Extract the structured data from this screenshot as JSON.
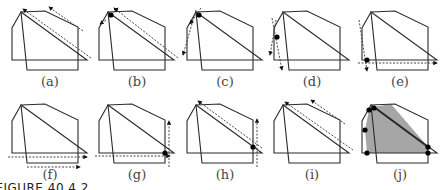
{
  "figure": {
    "caption": "FIGURE 40.4.2",
    "colors": {
      "outline": "#2a2a2a",
      "dashed": "#333333",
      "dot": "#000000",
      "shaded": "#a6a6a6"
    },
    "shapes": {
      "polygon_p": "pentagon",
      "polygon_q": "quadrilateral"
    },
    "panels": [
      {
        "label": "(a)",
        "step": "advance both edges along diagonal",
        "dots": [],
        "shaded": false
      },
      {
        "label": "(b)",
        "step": "intersection found at top-left",
        "dots": [
          "top-left"
        ],
        "shaded": false
      },
      {
        "label": "(c)",
        "step": "advance along left edges",
        "dots": [
          "top-left"
        ],
        "shaded": false
      },
      {
        "label": "(d)",
        "step": "intersection found at left",
        "dots": [
          "left"
        ],
        "shaded": false
      },
      {
        "label": "(e)",
        "step": "intersection found at bottom-left",
        "dots": [
          "bottom-left"
        ],
        "shaded": false
      },
      {
        "label": "(f)",
        "step": "advance along bottom edges",
        "dots": [],
        "shaded": false
      },
      {
        "label": "(g)",
        "step": "intersection found at bottom-right",
        "dots": [
          "bottom-right"
        ],
        "shaded": false
      },
      {
        "label": "(h)",
        "step": "intersection found at right",
        "dots": [
          "right"
        ],
        "shaded": false
      },
      {
        "label": "(i)",
        "step": "advance along diagonal edges",
        "dots": [],
        "shaded": false
      },
      {
        "label": "(j)",
        "step": "intersection polygon",
        "dots": [
          "top-left",
          "upper-left",
          "left",
          "bottom-left",
          "bottom-right",
          "right"
        ],
        "shaded": true
      }
    ]
  }
}
